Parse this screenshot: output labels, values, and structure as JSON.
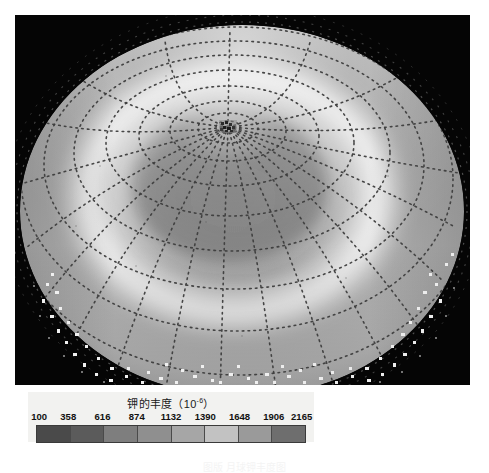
{
  "figure": {
    "kind": "lunar-polar-abundance-map",
    "background": "#ffffff",
    "plot_background": "#050505"
  },
  "legend": {
    "title_text": "钾的丰度（10",
    "title_exponent": "-6",
    "title_tail": "）",
    "title_full": "钾的丰度（10⁻⁶）",
    "ticks": [
      "100",
      "358",
      "616",
      "874",
      "1132",
      "1390",
      "1648",
      "1906",
      "2165"
    ],
    "segment_colors": [
      "#4a4a4a",
      "#5b5b5b",
      "#7e7e7e",
      "#8f8f8f",
      "#a6a6a6",
      "#c2c2c2",
      "#9a9a9a",
      "#6e6e6e"
    ],
    "border_color": "#3a3a3a",
    "box_color": "#f2f2f0"
  },
  "caption": {
    "text": "图版 月球钾丰度图"
  },
  "chart_data": {
    "type": "heatmap",
    "projection": "oblique polar orthographic",
    "colormap": "grayscale-cyclic",
    "unit": "10^-6",
    "vmin": 100,
    "vmax": 2165,
    "tick_values": [
      100,
      358,
      616,
      874,
      1132,
      1390,
      1648,
      1906,
      2165
    ],
    "tick_step": 258,
    "n_segments": 8,
    "grid": {
      "visible": true,
      "style": "dotted",
      "color": "#3c3c3c",
      "meridian_count": 18,
      "meridian_step_deg": 20,
      "latitude_circle_count": 8,
      "latitude_step_deg": 10
    },
    "features": [
      {
        "name": "pole-center",
        "x_px": 242,
        "y_px": 125,
        "note": "dark pixelated pole pixel cluster"
      },
      {
        "name": "bright-annulus",
        "note": "high-abundance ring surrounding the pole",
        "approx_value": 1900
      },
      {
        "name": "dark-interior",
        "note": "lower-abundance region just inside the bright ring",
        "approx_value": 900
      },
      {
        "name": "limb-speckle-band",
        "note": "scattered bright data pixels outside the disc limb"
      }
    ],
    "xlabel": "",
    "ylabel": "",
    "legend_position": "bottom-left"
  }
}
